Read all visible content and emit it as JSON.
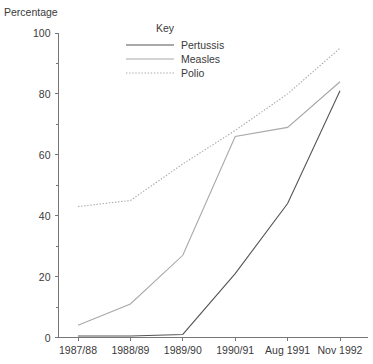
{
  "chart_data": {
    "type": "line",
    "title": "",
    "ylabel": "Percentage",
    "xlabel": "",
    "ylim": [
      0,
      100
    ],
    "grid": false,
    "legend_position": "top-center",
    "legend_title": "Key",
    "categories": [
      "1987/88",
      "1988/89",
      "1989/90",
      "1990/91",
      "Aug 1991",
      "Nov 1992"
    ],
    "y_ticks_major": [
      0,
      20,
      40,
      60,
      80,
      100
    ],
    "y_ticks_minor": [
      10,
      30,
      50,
      70,
      90
    ],
    "series": [
      {
        "name": "Pertussis",
        "style": "solid-dark",
        "color": "#555555",
        "values": [
          0.5,
          0.5,
          1,
          21,
          44,
          81
        ]
      },
      {
        "name": "Measles",
        "style": "solid-light",
        "color": "#a8a8a8",
        "values": [
          4,
          11,
          27,
          66,
          69,
          84
        ]
      },
      {
        "name": "Polio",
        "style": "dotted",
        "color": "#a8a8a8",
        "values": [
          43,
          45,
          57,
          68,
          80,
          95
        ]
      }
    ]
  },
  "axis": {
    "y_title": "Percentage",
    "y_tick_labels": [
      "100",
      "80",
      "60",
      "40",
      "20",
      "0"
    ],
    "x_tick_labels": [
      "1987/88",
      "1988/89",
      "1989/90",
      "1990/91",
      "Aug 1991",
      "Nov 1992"
    ]
  },
  "legend": {
    "title": "Key",
    "entries": [
      {
        "label": "Pertussis"
      },
      {
        "label": "Measles"
      },
      {
        "label": "Polio"
      }
    ]
  },
  "colors": {
    "axis": "#767676",
    "text": "#3a3a3a",
    "pertussis": "#555555",
    "measles": "#a8a8a8",
    "polio": "#a8a8a8",
    "background": "#ffffff"
  }
}
